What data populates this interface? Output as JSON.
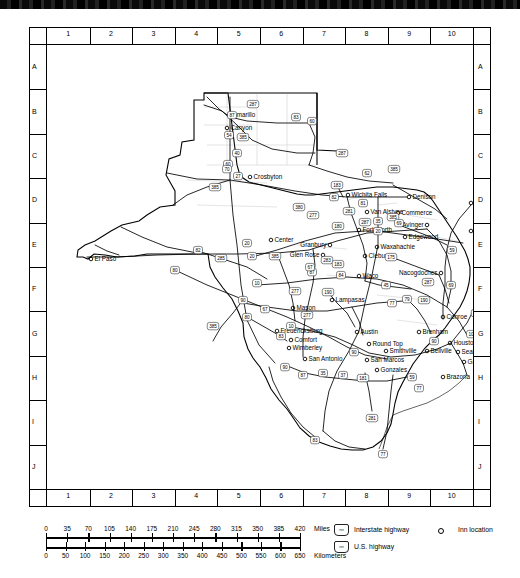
{
  "map": {
    "title": "Texas state highway map with inn locations",
    "grid": {
      "columns": [
        "1",
        "2",
        "3",
        "4",
        "5",
        "6",
        "7",
        "8",
        "9",
        "10"
      ],
      "rows": [
        "A",
        "B",
        "C",
        "D",
        "E",
        "F",
        "G",
        "H",
        "I",
        "J"
      ]
    },
    "cities": [
      {
        "name": "Amarillo",
        "x": 182,
        "y": 70,
        "anchor": "left"
      },
      {
        "name": "Canyon",
        "x": 180,
        "y": 83,
        "anchor": "left"
      },
      {
        "name": "Crosbyton",
        "x": 203,
        "y": 132,
        "anchor": "left"
      },
      {
        "name": "Wichita Falls",
        "x": 301,
        "y": 150,
        "anchor": "left"
      },
      {
        "name": "Denison",
        "x": 362,
        "y": 152,
        "anchor": "left"
      },
      {
        "name": "Texarkana",
        "x": 424,
        "y": 158,
        "anchor": "left"
      },
      {
        "name": "Van Alstyne",
        "x": 320,
        "y": 167,
        "anchor": "left"
      },
      {
        "name": "Commerce",
        "x": 351,
        "y": 168,
        "anchor": "left"
      },
      {
        "name": "Avinger",
        "x": 380,
        "y": 180,
        "anchor": "right"
      },
      {
        "name": "Jefferson",
        "x": 424,
        "y": 186,
        "anchor": "left"
      },
      {
        "name": "Fort Worth",
        "x": 312,
        "y": 185,
        "anchor": "left"
      },
      {
        "name": "Edgewood",
        "x": 358,
        "y": 192,
        "anchor": "left"
      },
      {
        "name": "Center",
        "x": 224,
        "y": 195,
        "anchor": "left"
      },
      {
        "name": "Granbury",
        "x": 283,
        "y": 200,
        "anchor": "right"
      },
      {
        "name": "Waxahachie",
        "x": 330,
        "y": 202,
        "anchor": "left"
      },
      {
        "name": "Glen Rose",
        "x": 276,
        "y": 210,
        "anchor": "right"
      },
      {
        "name": "Cleburne",
        "x": 318,
        "y": 211,
        "anchor": "left"
      },
      {
        "name": "El Paso",
        "x": 44,
        "y": 214,
        "anchor": "left"
      },
      {
        "name": "Waco",
        "x": 312,
        "y": 231,
        "anchor": "left"
      },
      {
        "name": "Nacogdoches",
        "x": 394,
        "y": 228,
        "anchor": "right"
      },
      {
        "name": "San Augustine",
        "x": 432,
        "y": 230,
        "anchor": "left"
      },
      {
        "name": "Lampasas",
        "x": 285,
        "y": 255,
        "anchor": "left"
      },
      {
        "name": "Mason",
        "x": 246,
        "y": 263,
        "anchor": "left"
      },
      {
        "name": "Conroe",
        "x": 396,
        "y": 272,
        "anchor": "left"
      },
      {
        "name": "Fredericksburg",
        "x": 230,
        "y": 286,
        "anchor": "left"
      },
      {
        "name": "Austin",
        "x": 310,
        "y": 287,
        "anchor": "left"
      },
      {
        "name": "Brenham",
        "x": 372,
        "y": 287,
        "anchor": "left"
      },
      {
        "name": "Comfort",
        "x": 244,
        "y": 295,
        "anchor": "left"
      },
      {
        "name": "Round Top",
        "x": 322,
        "y": 299,
        "anchor": "left"
      },
      {
        "name": "Houston",
        "x": 403,
        "y": 298,
        "anchor": "left"
      },
      {
        "name": "Wimberley",
        "x": 242,
        "y": 303,
        "anchor": "left"
      },
      {
        "name": "Smithville",
        "x": 339,
        "y": 306,
        "anchor": "left"
      },
      {
        "name": "Bellville",
        "x": 380,
        "y": 306,
        "anchor": "left"
      },
      {
        "name": "Seabrook",
        "x": 411,
        "y": 307,
        "anchor": "left"
      },
      {
        "name": "San Antonio",
        "x": 258,
        "y": 314,
        "anchor": "left"
      },
      {
        "name": "San Marcos",
        "x": 320,
        "y": 315,
        "anchor": "left"
      },
      {
        "name": "Galveston",
        "x": 417,
        "y": 317,
        "anchor": "left"
      },
      {
        "name": "Gonzales",
        "x": 330,
        "y": 325,
        "anchor": "left"
      },
      {
        "name": "Brazoria",
        "x": 396,
        "y": 332,
        "anchor": "left"
      }
    ],
    "shields": [
      {
        "num": "87",
        "x": 185,
        "y": 70,
        "type": "us"
      },
      {
        "num": "287",
        "x": 206,
        "y": 59,
        "type": "us"
      },
      {
        "num": "83",
        "x": 249,
        "y": 72,
        "type": "us"
      },
      {
        "num": "60",
        "x": 265,
        "y": 76,
        "type": "us"
      },
      {
        "num": "54",
        "x": 182,
        "y": 90,
        "type": "us"
      },
      {
        "num": "385",
        "x": 196,
        "y": 92,
        "type": "us"
      },
      {
        "num": "60",
        "x": 181,
        "y": 119,
        "type": "us"
      },
      {
        "num": "40",
        "x": 190,
        "y": 108,
        "type": "int"
      },
      {
        "num": "27",
        "x": 191,
        "y": 131,
        "type": "int"
      },
      {
        "num": "287",
        "x": 295,
        "y": 108,
        "type": "us"
      },
      {
        "num": "62",
        "x": 320,
        "y": 128,
        "type": "us"
      },
      {
        "num": "385",
        "x": 347,
        "y": 124,
        "type": "us"
      },
      {
        "num": "183",
        "x": 290,
        "y": 140,
        "type": "us"
      },
      {
        "num": "82",
        "x": 287,
        "y": 152,
        "type": "us"
      },
      {
        "num": "81",
        "x": 316,
        "y": 158,
        "type": "us"
      },
      {
        "num": "281",
        "x": 302,
        "y": 166,
        "type": "us"
      },
      {
        "num": "70",
        "x": 180,
        "y": 124,
        "type": "us"
      },
      {
        "num": "385",
        "x": 168,
        "y": 142,
        "type": "us"
      },
      {
        "num": "380",
        "x": 252,
        "y": 162,
        "type": "us"
      },
      {
        "num": "277",
        "x": 266,
        "y": 170,
        "type": "us"
      },
      {
        "num": "287",
        "x": 318,
        "y": 177,
        "type": "us"
      },
      {
        "num": "35",
        "x": 331,
        "y": 176,
        "type": "int"
      },
      {
        "num": "385",
        "x": 346,
        "y": 172,
        "type": "us"
      },
      {
        "num": "20",
        "x": 331,
        "y": 186,
        "type": "int"
      },
      {
        "num": "69",
        "x": 352,
        "y": 178,
        "type": "us"
      },
      {
        "num": "59",
        "x": 405,
        "y": 205,
        "type": "us"
      },
      {
        "num": "175",
        "x": 344,
        "y": 212,
        "type": "us"
      },
      {
        "num": "180",
        "x": 291,
        "y": 181,
        "type": "us"
      },
      {
        "num": "20",
        "x": 200,
        "y": 198,
        "type": "int"
      },
      {
        "num": "283",
        "x": 280,
        "y": 215,
        "type": "us"
      },
      {
        "num": "87",
        "x": 265,
        "y": 227,
        "type": "us"
      },
      {
        "num": "183",
        "x": 291,
        "y": 219,
        "type": "us"
      },
      {
        "num": "84",
        "x": 294,
        "y": 230,
        "type": "us"
      },
      {
        "num": "82",
        "x": 151,
        "y": 205,
        "type": "us"
      },
      {
        "num": "285",
        "x": 174,
        "y": 213,
        "type": "us"
      },
      {
        "num": "20",
        "x": 205,
        "y": 211,
        "type": "int"
      },
      {
        "num": "385",
        "x": 228,
        "y": 211,
        "type": "us"
      },
      {
        "num": "67",
        "x": 263,
        "y": 222,
        "type": "us"
      },
      {
        "num": "10",
        "x": 210,
        "y": 238,
        "type": "int"
      },
      {
        "num": "80",
        "x": 128,
        "y": 225,
        "type": "int"
      },
      {
        "num": "90",
        "x": 196,
        "y": 255,
        "type": "us"
      },
      {
        "num": "67",
        "x": 218,
        "y": 264,
        "type": "us"
      },
      {
        "num": "385",
        "x": 166,
        "y": 281,
        "type": "us"
      },
      {
        "num": "80",
        "x": 200,
        "y": 272,
        "type": "us"
      },
      {
        "num": "277",
        "x": 248,
        "y": 246,
        "type": "us"
      },
      {
        "num": "190",
        "x": 281,
        "y": 247,
        "type": "us"
      },
      {
        "num": "45",
        "x": 339,
        "y": 240,
        "type": "int"
      },
      {
        "num": "287",
        "x": 381,
        "y": 237,
        "type": "us"
      },
      {
        "num": "69",
        "x": 404,
        "y": 240,
        "type": "us"
      },
      {
        "num": "79",
        "x": 360,
        "y": 254,
        "type": "us"
      },
      {
        "num": "190",
        "x": 377,
        "y": 255,
        "type": "us"
      },
      {
        "num": "77",
        "x": 345,
        "y": 258,
        "type": "us"
      },
      {
        "num": "277",
        "x": 260,
        "y": 270,
        "type": "us"
      },
      {
        "num": "10",
        "x": 244,
        "y": 281,
        "type": "int"
      },
      {
        "num": "83",
        "x": 234,
        "y": 291,
        "type": "us"
      },
      {
        "num": "190",
        "x": 430,
        "y": 268,
        "type": "us"
      },
      {
        "num": "96",
        "x": 436,
        "y": 279,
        "type": "us"
      },
      {
        "num": "10",
        "x": 424,
        "y": 289,
        "type": "int"
      },
      {
        "num": "90",
        "x": 387,
        "y": 296,
        "type": "us"
      },
      {
        "num": "90",
        "x": 307,
        "y": 307,
        "type": "us"
      },
      {
        "num": "87",
        "x": 256,
        "y": 330,
        "type": "us"
      },
      {
        "num": "35",
        "x": 276,
        "y": 328,
        "type": "int"
      },
      {
        "num": "37",
        "x": 296,
        "y": 330,
        "type": "int"
      },
      {
        "num": "181",
        "x": 316,
        "y": 333,
        "type": "us"
      },
      {
        "num": "59",
        "x": 365,
        "y": 332,
        "type": "us"
      },
      {
        "num": "77",
        "x": 372,
        "y": 343,
        "type": "us"
      },
      {
        "num": "281",
        "x": 325,
        "y": 373,
        "type": "us"
      },
      {
        "num": "83",
        "x": 268,
        "y": 395,
        "type": "us"
      },
      {
        "num": "77",
        "x": 336,
        "y": 409,
        "type": "us"
      },
      {
        "num": "90",
        "x": 238,
        "y": 322,
        "type": "us"
      }
    ]
  },
  "scale": {
    "miles": {
      "ticks": [
        "0",
        "35",
        "70",
        "105",
        "140",
        "175",
        "210",
        "245",
        "280",
        "315",
        "350",
        "385",
        "420"
      ],
      "unit": "Miles"
    },
    "kilometers": {
      "ticks": [
        "0",
        "50",
        "100",
        "150",
        "200",
        "250",
        "300",
        "350",
        "400",
        "450",
        "500",
        "550",
        "600",
        "650"
      ],
      "unit": "Kilometers"
    }
  },
  "legend": {
    "interstate": {
      "label": "Interstate highway",
      "symbol": "nn"
    },
    "us_highway": {
      "label": "U.S. highway",
      "symbol": "nn"
    },
    "inn": {
      "label": "Inn location",
      "symbol": "circle"
    }
  }
}
